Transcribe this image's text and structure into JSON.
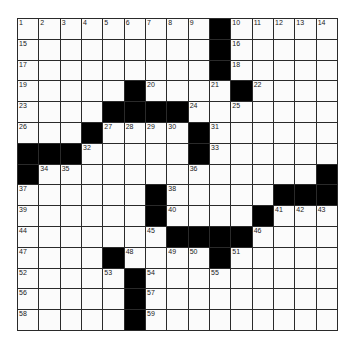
{
  "puzzle": {
    "rows": 15,
    "cols": 15,
    "black_symbol": "#",
    "grid": [
      [
        1,
        2,
        3,
        4,
        5,
        6,
        7,
        8,
        9,
        "#",
        10,
        11,
        12,
        13,
        14
      ],
      [
        15,
        0,
        0,
        0,
        0,
        0,
        0,
        0,
        0,
        "#",
        16,
        0,
        0,
        0,
        0
      ],
      [
        17,
        0,
        0,
        0,
        0,
        0,
        0,
        0,
        0,
        "#",
        18,
        0,
        0,
        0,
        0
      ],
      [
        19,
        0,
        0,
        0,
        0,
        "#",
        20,
        0,
        0,
        21,
        "#",
        22,
        0,
        0,
        0
      ],
      [
        23,
        0,
        0,
        0,
        "#",
        "#",
        "#",
        "#",
        24,
        0,
        25,
        0,
        0,
        0,
        0
      ],
      [
        26,
        0,
        0,
        "#",
        27,
        28,
        29,
        30,
        "#",
        31,
        0,
        0,
        0,
        0,
        0
      ],
      [
        "#",
        "#",
        "#",
        32,
        0,
        0,
        0,
        0,
        "#",
        33,
        0,
        0,
        0,
        0,
        0
      ],
      [
        "#",
        34,
        35,
        0,
        0,
        0,
        0,
        0,
        36,
        0,
        0,
        0,
        0,
        0,
        "#"
      ],
      [
        37,
        0,
        0,
        0,
        0,
        0,
        "#",
        38,
        0,
        0,
        0,
        0,
        "#",
        "#",
        "#"
      ],
      [
        39,
        0,
        0,
        0,
        0,
        0,
        "#",
        40,
        0,
        0,
        0,
        "#",
        41,
        42,
        43
      ],
      [
        44,
        0,
        0,
        0,
        0,
        0,
        45,
        "#",
        "#",
        "#",
        "#",
        46,
        0,
        0,
        0
      ],
      [
        47,
        0,
        0,
        0,
        "#",
        48,
        0,
        49,
        50,
        "#",
        51,
        0,
        0,
        0,
        0
      ],
      [
        52,
        0,
        0,
        0,
        53,
        "#",
        54,
        0,
        0,
        55,
        0,
        0,
        0,
        0,
        0
      ],
      [
        56,
        0,
        0,
        0,
        0,
        "#",
        57,
        0,
        0,
        0,
        0,
        0,
        0,
        0,
        0
      ],
      [
        58,
        0,
        0,
        0,
        0,
        "#",
        59,
        0,
        0,
        0,
        0,
        0,
        0,
        0,
        0
      ]
    ],
    "colors": {
      "black": "#000000",
      "white": "#fbfbfb",
      "line": "#2a2a2a"
    }
  }
}
